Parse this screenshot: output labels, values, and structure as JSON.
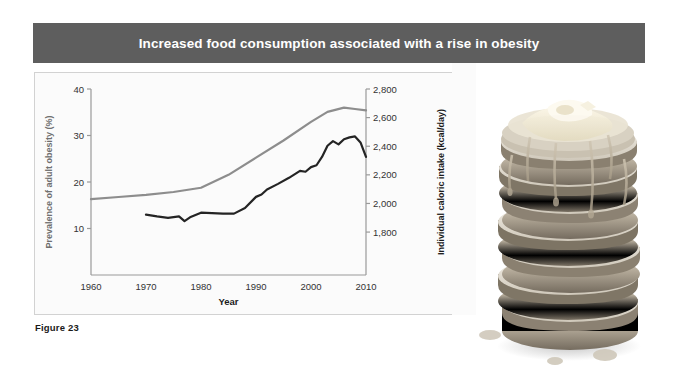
{
  "header": {
    "title": "Increased food consumption associated with a rise in obesity",
    "bar_color": "#5e5e5e",
    "text_color": "#ffffff"
  },
  "caption": {
    "label": "Figure 23"
  },
  "photo": {
    "alt_name": "pancake-stack-photo",
    "description": "Tall stack of pancakes with butter on top and syrup dripping down the sides"
  },
  "chart_data": {
    "type": "line",
    "title": "Increased food consumption associated with a rise in obesity",
    "xlabel": "Year",
    "grid": false,
    "legend": "none",
    "xlim": [
      1960,
      2010
    ],
    "xticks": [
      1960,
      1970,
      1980,
      1990,
      2000,
      2010
    ],
    "xtick_labels": [
      "1960",
      "1970",
      "1980",
      "1990",
      "2000",
      "2010"
    ],
    "axes": [
      {
        "side": "left",
        "label": "Prevalence of adult obesity (%)",
        "ylim": [
          0,
          40
        ],
        "ticks": [
          10,
          20,
          30,
          40
        ],
        "tick_labels": [
          "10",
          "20",
          "30",
          "40"
        ]
      },
      {
        "side": "right",
        "label": "Individual caloric intake (kcal/day)",
        "ylim": [
          1500,
          2800
        ],
        "ticks": [
          1800,
          2000,
          2200,
          2400,
          2600,
          2800
        ],
        "tick_labels": [
          "1,800",
          "2,000",
          "2,200",
          "2,400",
          "2,600",
          "2,800"
        ]
      }
    ],
    "series": [
      {
        "name": "Individual caloric intake",
        "axis": "right",
        "color": "#8d8d8d",
        "units": "kcal/day",
        "x": [
          1960,
          1965,
          1970,
          1975,
          1980,
          1985,
          1990,
          1995,
          2000,
          2003,
          2006,
          2008,
          2010
        ],
        "values": [
          2030,
          2045,
          2060,
          2080,
          2110,
          2200,
          2320,
          2440,
          2570,
          2640,
          2670,
          2660,
          2650
        ]
      },
      {
        "name": "Prevalence of adult obesity",
        "axis": "left",
        "color": "#242424",
        "units": "%",
        "x": [
          1970,
          1972,
          1974,
          1976,
          1977,
          1978,
          1980,
          1982,
          1984,
          1986,
          1988,
          1990,
          1991,
          1992,
          1994,
          1996,
          1998,
          1999,
          2000,
          2001,
          2002,
          2003,
          2004,
          2005,
          2006,
          2007,
          2008,
          2009,
          2010
        ],
        "values": [
          13.0,
          12.6,
          12.3,
          12.6,
          11.6,
          12.4,
          13.4,
          13.3,
          13.2,
          13.2,
          14.4,
          16.8,
          17.3,
          18.4,
          19.6,
          20.9,
          22.4,
          22.2,
          23.2,
          23.6,
          25.4,
          27.8,
          28.8,
          28.1,
          29.2,
          29.6,
          29.8,
          28.5,
          25.4
        ]
      }
    ]
  }
}
